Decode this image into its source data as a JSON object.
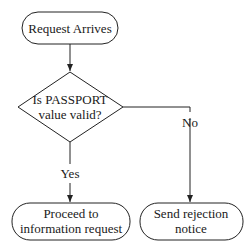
{
  "diagram": {
    "type": "flowchart",
    "nodes": [
      {
        "id": "start",
        "shape": "rounded",
        "lines": [
          "Request Arrives"
        ]
      },
      {
        "id": "decision",
        "shape": "diamond",
        "lines": [
          "Is PASSPORT",
          "value valid?"
        ]
      },
      {
        "id": "proceed",
        "shape": "rounded",
        "lines": [
          "Proceed to",
          "information request"
        ]
      },
      {
        "id": "reject",
        "shape": "rounded",
        "lines": [
          "Send rejection",
          "notice"
        ]
      }
    ],
    "edges": [
      {
        "from": "start",
        "to": "decision",
        "label": ""
      },
      {
        "from": "decision",
        "to": "proceed",
        "label": "Yes"
      },
      {
        "from": "decision",
        "to": "reject",
        "label": "No"
      }
    ]
  },
  "colors": {
    "stroke": "#222222",
    "text": "#1a1a1a",
    "background": "#ffffff"
  }
}
